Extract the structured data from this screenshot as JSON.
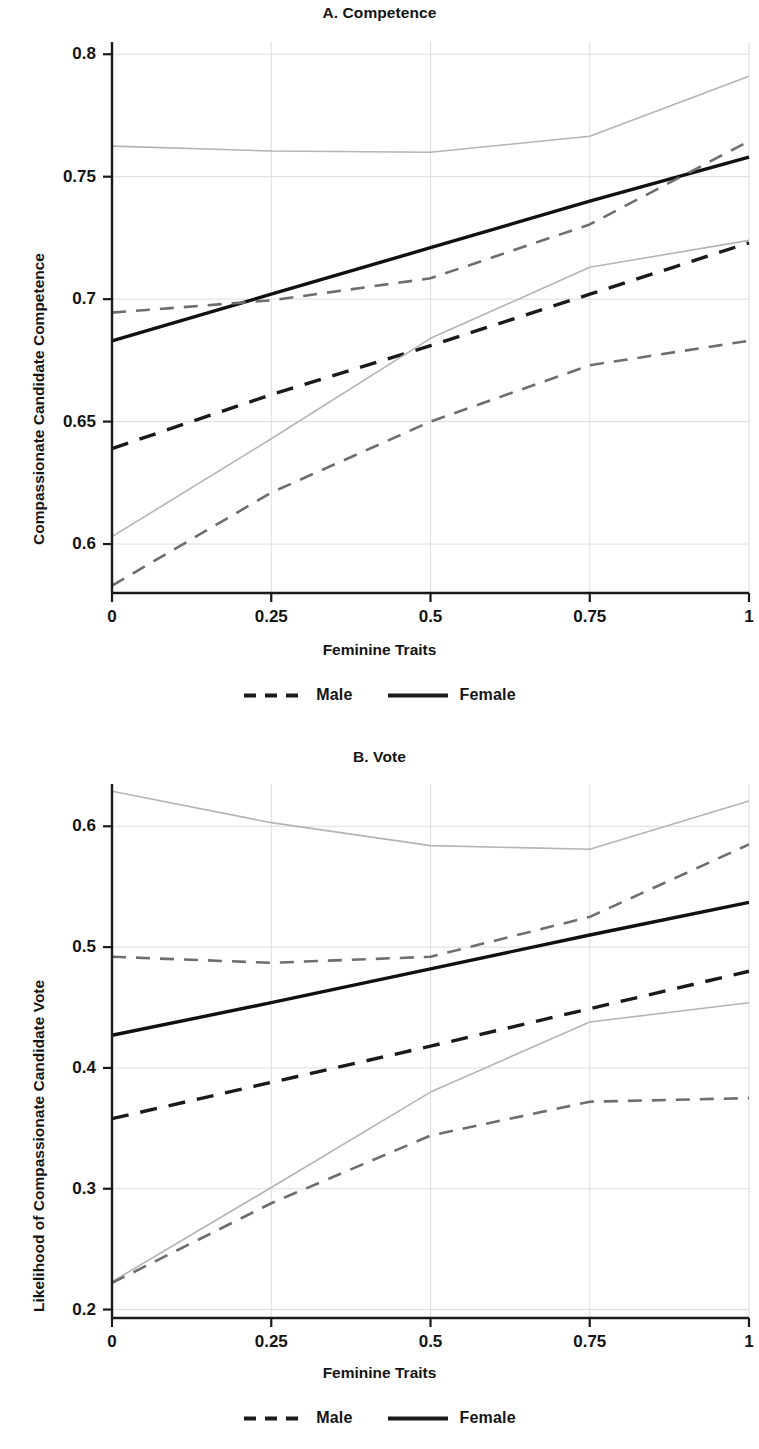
{
  "figure": {
    "xlabel": "Feminine Traits",
    "legend": [
      {
        "label": "Male",
        "style": "dashed",
        "color": "#1a1a1a"
      },
      {
        "label": "Female",
        "style": "solid",
        "color": "#1a1a1a"
      }
    ]
  },
  "chart_data": [
    {
      "type": "line",
      "id": "panel-a",
      "title": "A. Competence",
      "xlabel": "Feminine Traits",
      "ylabel": "Compassionate Candidate Competence",
      "xlim": [
        0,
        1
      ],
      "ylim": [
        0.58,
        0.805
      ],
      "xticks": [
        0,
        0.25,
        0.5,
        0.75,
        1
      ],
      "xticklabels": [
        "0",
        "0.25",
        "0.5",
        "0.75",
        "1"
      ],
      "yticks": [
        0.6,
        0.65,
        0.7,
        0.75,
        0.8
      ],
      "yticklabels": [
        "0.6",
        "0.65",
        "0.7",
        "0.75",
        "0.8"
      ],
      "grid": true,
      "legend_position": "below",
      "x": [
        0,
        0.25,
        0.5,
        0.75,
        1
      ],
      "series": [
        {
          "name": "Male",
          "style": "dashed",
          "color": "#1a1a1a",
          "width": 3.4,
          "values": [
            0.639,
            0.661,
            0.681,
            0.702,
            0.723
          ]
        },
        {
          "name": "Male upper CI",
          "style": "solid",
          "color": "#b4b4b4",
          "width": 1.6,
          "values": [
            0.603,
            0.643,
            0.684,
            0.713,
            0.724
          ]
        },
        {
          "name": "Male lower CI",
          "style": "dashed",
          "color": "#6e6e6e",
          "width": 2.6,
          "values": [
            0.583,
            0.621,
            0.65,
            0.673,
            0.683
          ]
        },
        {
          "name": "Female",
          "style": "solid",
          "color": "#111111",
          "width": 3.4,
          "values": [
            0.683,
            0.702,
            0.721,
            0.74,
            0.758
          ]
        },
        {
          "name": "Female upper CI",
          "style": "solid",
          "color": "#b4b4b4",
          "width": 1.6,
          "values": [
            0.7625,
            0.7605,
            0.76,
            0.7665,
            0.791
          ]
        },
        {
          "name": "Female lower CI",
          "style": "dashed",
          "color": "#6e6e6e",
          "width": 2.6,
          "values": [
            0.6945,
            0.6995,
            0.7085,
            0.7305,
            0.7645
          ]
        }
      ]
    },
    {
      "type": "line",
      "id": "panel-b",
      "title": "B. Vote",
      "xlabel": "Feminine Traits",
      "ylabel": "Likelihood of Compassionate Candidate Vote",
      "xlim": [
        0,
        1
      ],
      "ylim": [
        0.193,
        0.635
      ],
      "xticks": [
        0,
        0.25,
        0.5,
        0.75,
        1
      ],
      "xticklabels": [
        "0",
        "0.25",
        "0.5",
        "0.75",
        "1"
      ],
      "yticks": [
        0.2,
        0.3,
        0.4,
        0.5,
        0.6
      ],
      "yticklabels": [
        "0.2",
        "0.3",
        "0.4",
        "0.5",
        "0.6"
      ],
      "grid": true,
      "legend_position": "below",
      "x": [
        0,
        0.25,
        0.5,
        0.75,
        1
      ],
      "series": [
        {
          "name": "Male",
          "style": "dashed",
          "color": "#1a1a1a",
          "width": 3.4,
          "values": [
            0.358,
            0.388,
            0.418,
            0.449,
            0.48
          ]
        },
        {
          "name": "Male upper CI",
          "style": "solid",
          "color": "#b4b4b4",
          "width": 1.6,
          "values": [
            0.223,
            0.301,
            0.38,
            0.438,
            0.454
          ]
        },
        {
          "name": "Male lower CI",
          "style": "dashed",
          "color": "#6e6e6e",
          "width": 2.6,
          "values": [
            0.222,
            0.288,
            0.344,
            0.372,
            0.375
          ]
        },
        {
          "name": "Female",
          "style": "solid",
          "color": "#111111",
          "width": 3.4,
          "values": [
            0.427,
            0.454,
            0.482,
            0.51,
            0.537
          ]
        },
        {
          "name": "Female upper CI",
          "style": "solid",
          "color": "#b4b4b4",
          "width": 1.6,
          "values": [
            0.629,
            0.603,
            0.584,
            0.581,
            0.621
          ]
        },
        {
          "name": "Female lower CI",
          "style": "dashed",
          "color": "#6e6e6e",
          "width": 2.6,
          "values": [
            0.492,
            0.487,
            0.492,
            0.525,
            0.585
          ]
        }
      ]
    }
  ]
}
